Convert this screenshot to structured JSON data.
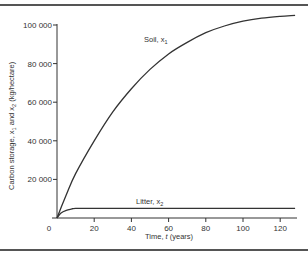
{
  "chart_data": {
    "type": "line",
    "title": "",
    "xlabel": "Time, t (years)",
    "ylabel": "Carbon storage, x1 and x2 (kg/hectare)",
    "xlim": [
      0,
      130
    ],
    "ylim": [
      0,
      100000
    ],
    "x_ticks": [
      0,
      20,
      40,
      60,
      80,
      100,
      120
    ],
    "x_tick_labels": [
      "0",
      "20",
      "40",
      "60",
      "80",
      "100",
      "120"
    ],
    "y_ticks": [
      20000,
      40000,
      60000,
      80000,
      100000
    ],
    "y_tick_labels": [
      "20 000",
      "40 000",
      "60 000",
      "80 000",
      "100 000"
    ],
    "grid": false,
    "legend": "inline labels",
    "series": [
      {
        "name": "Soil, x1",
        "x": [
          0,
          5,
          10,
          20,
          30,
          40,
          50,
          60,
          70,
          80,
          90,
          100,
          110,
          120,
          128
        ],
        "values": [
          0,
          12000,
          23000,
          40000,
          55000,
          67000,
          77000,
          85000,
          91000,
          96000,
          99500,
          102000,
          103500,
          104500,
          105000
        ]
      },
      {
        "name": "Litter, x2",
        "x": [
          0,
          2,
          5,
          8,
          10,
          20,
          40,
          60,
          80,
          100,
          120,
          128
        ],
        "values": [
          0,
          2500,
          4000,
          4700,
          5000,
          5000,
          5000,
          5000,
          5000,
          5000,
          5000,
          5000
        ]
      }
    ]
  },
  "labels": {
    "soil": "Soil, x",
    "soil_sub": "1",
    "litter": "Litter, x",
    "litter_sub": "2",
    "ylabel_main": "Carbon storage, x",
    "ylabel_sub1": "1",
    "ylabel_mid": " and x",
    "ylabel_sub2": "2",
    "ylabel_units": "  (kg/hectare)",
    "xlabel_pre": "Time, ",
    "xlabel_var": "t",
    "xlabel_post": " (years)",
    "origin": "0"
  },
  "colors": {
    "line": "#333333",
    "frame": "#555555"
  }
}
